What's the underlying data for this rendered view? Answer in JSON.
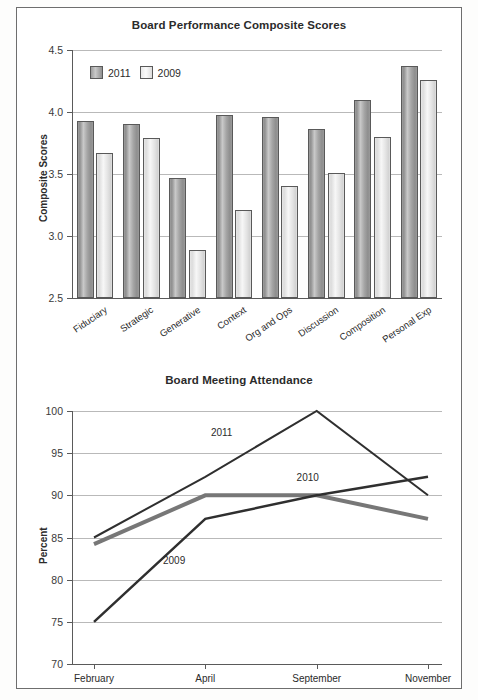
{
  "page": {
    "background": "#ffffff",
    "frame_color": "#6e6e6e"
  },
  "chart_data": [
    {
      "id": "board-performance",
      "type": "bar",
      "title": "Board Performance Composite Scores",
      "xlabel": "",
      "ylabel": "Composite Scores",
      "ylim": [
        2.5,
        4.5
      ],
      "ytick_values": [
        2.5,
        3.0,
        3.5,
        4.0,
        4.5
      ],
      "ytick_labels": [
        "2.5",
        "3.0",
        "3.5",
        "4.0",
        "4.5"
      ],
      "grid": true,
      "legend_position": "top-left",
      "categories": [
        "Fiduciary",
        "Strategic",
        "Generative",
        "Context",
        "Org and Ops",
        "Discussion",
        "Composition",
        "Personal Exp"
      ],
      "series": [
        {
          "name": "2011",
          "color": "#9a9a9a",
          "values": [
            3.93,
            3.9,
            3.47,
            3.98,
            3.96,
            3.86,
            4.1,
            4.37
          ]
        },
        {
          "name": "2009",
          "color": "#e8e8e8",
          "values": [
            3.67,
            3.79,
            2.89,
            3.21,
            3.4,
            3.51,
            3.8,
            4.26
          ]
        }
      ]
    },
    {
      "id": "board-meeting-attendance",
      "type": "line",
      "title": "Board Meeting Attendance",
      "xlabel": "",
      "ylabel": "Percent",
      "ylim": [
        70,
        100
      ],
      "ytick_values": [
        70,
        75,
        80,
        85,
        90,
        95,
        100
      ],
      "ytick_labels": [
        "70",
        "75",
        "80",
        "85",
        "90",
        "95",
        "100"
      ],
      "grid": true,
      "x": [
        "February",
        "April",
        "September",
        "November"
      ],
      "series": [
        {
          "name": "2011",
          "color": "#2f2f2f",
          "width": 2,
          "values": [
            85.0,
            92.2,
            100.0,
            90.0
          ],
          "label_at": {
            "x_index": 1.05,
            "value": 97.3
          }
        },
        {
          "name": "2010",
          "color": "#777777",
          "width": 4,
          "values": [
            84.2,
            90.0,
            90.0,
            87.2
          ],
          "label_at": {
            "x_index": 1.82,
            "value": 92.0
          }
        },
        {
          "name": "2009",
          "color": "#2f2f2f",
          "width": 2.5,
          "values": [
            75.0,
            87.2,
            90.0,
            92.2
          ],
          "label_at": {
            "x_index": 0.62,
            "value": 82.1
          }
        }
      ]
    }
  ]
}
